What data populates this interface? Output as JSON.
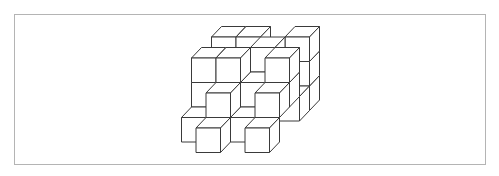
{
  "diagram": {
    "type": "isometric-cube-stack",
    "colors": {
      "line": "#3a3a3a",
      "fill": "#ffffff",
      "frame": "#b4b4b4",
      "background": "#ffffff"
    },
    "projection": {
      "origin_x": 196,
      "origin_y": 128,
      "cube_size": 24.5,
      "depth_dx": 10,
      "depth_dy": -10.5
    },
    "voxels": [
      {
        "c": 2,
        "r": 0,
        "k": 4
      },
      {
        "c": 2,
        "r": 1,
        "k": 4
      },
      {
        "c": 2,
        "r": 2,
        "k": 4
      },
      {
        "c": -1,
        "r": 2,
        "k": 4
      },
      {
        "c": 0,
        "r": 2,
        "k": 4
      },
      {
        "c": 2,
        "r": 0,
        "k": 3
      },
      {
        "c": 1,
        "r": 2,
        "k": 3
      },
      {
        "c": -1,
        "r": 1,
        "k": 2
      },
      {
        "c": 1,
        "r": 1,
        "k": 2
      },
      {
        "c": -1,
        "r": 2,
        "k": 2
      },
      {
        "c": 0,
        "r": 2,
        "k": 2
      },
      {
        "c": 2,
        "r": 2,
        "k": 2
      },
      {
        "c": 2,
        "r": 1,
        "k": 2
      },
      {
        "c": -1,
        "r": 0,
        "k": 1
      },
      {
        "c": 1,
        "r": 0,
        "k": 1
      },
      {
        "c": 0,
        "r": 1,
        "k": 1
      },
      {
        "c": 2,
        "r": 1,
        "k": 1
      },
      {
        "c": 0,
        "r": 0,
        "k": 0
      },
      {
        "c": 2,
        "r": 0,
        "k": 0
      }
    ],
    "cube_count": 19
  }
}
